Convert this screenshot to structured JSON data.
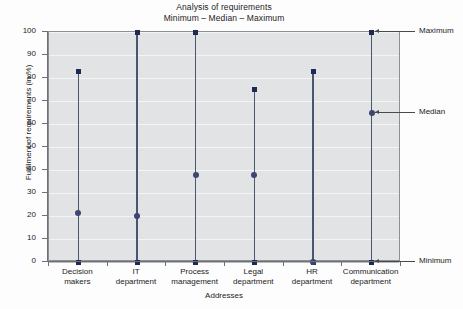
{
  "chart_data": {
    "type": "scatter",
    "title": "Analysis of requirements",
    "subtitle": "Minimum – Median – Maximum",
    "xlabel": "Addresses",
    "ylabel": "Fulfilment of requirements (in %)",
    "ylim": [
      0,
      100
    ],
    "ytick_labels": [
      "0",
      "10",
      "20",
      "30",
      "40",
      "50",
      "60",
      "70",
      "80",
      "90",
      "100"
    ],
    "yticks": [
      0,
      10,
      20,
      30,
      40,
      50,
      60,
      70,
      80,
      90,
      100
    ],
    "grid": true,
    "legend_position": "right-annotations",
    "categories": [
      "Decision makers",
      "IT department",
      "Process management",
      "Legal department",
      "HR department",
      "Communication department"
    ],
    "category_lines": [
      [
        "Decision",
        "makers"
      ],
      [
        "IT",
        "department"
      ],
      [
        "Process",
        "management"
      ],
      [
        "Legal",
        "department"
      ],
      [
        "HR",
        "department"
      ],
      [
        "Communication",
        "department"
      ]
    ],
    "series": [
      {
        "name": "Minimum",
        "values": [
          0,
          0,
          0,
          0,
          0,
          0
        ]
      },
      {
        "name": "Median",
        "values": [
          21.5,
          20,
          38,
          38,
          0,
          65
        ]
      },
      {
        "name": "Maximum",
        "values": [
          83,
          100,
          100,
          75,
          83,
          100
        ]
      }
    ],
    "annotations": [
      {
        "label": "Maximum",
        "value": 100
      },
      {
        "label": "Median",
        "value": 65
      },
      {
        "label": "Minimum",
        "value": 0
      }
    ],
    "colors": {
      "plot_background": "#e2e3e5",
      "marker": "#1f2a54",
      "median_marker": "#3d4670",
      "range_line": "#4c5570",
      "gridline": "#f3f4f5",
      "axis": "#6e7075",
      "text": "#232323"
    }
  }
}
